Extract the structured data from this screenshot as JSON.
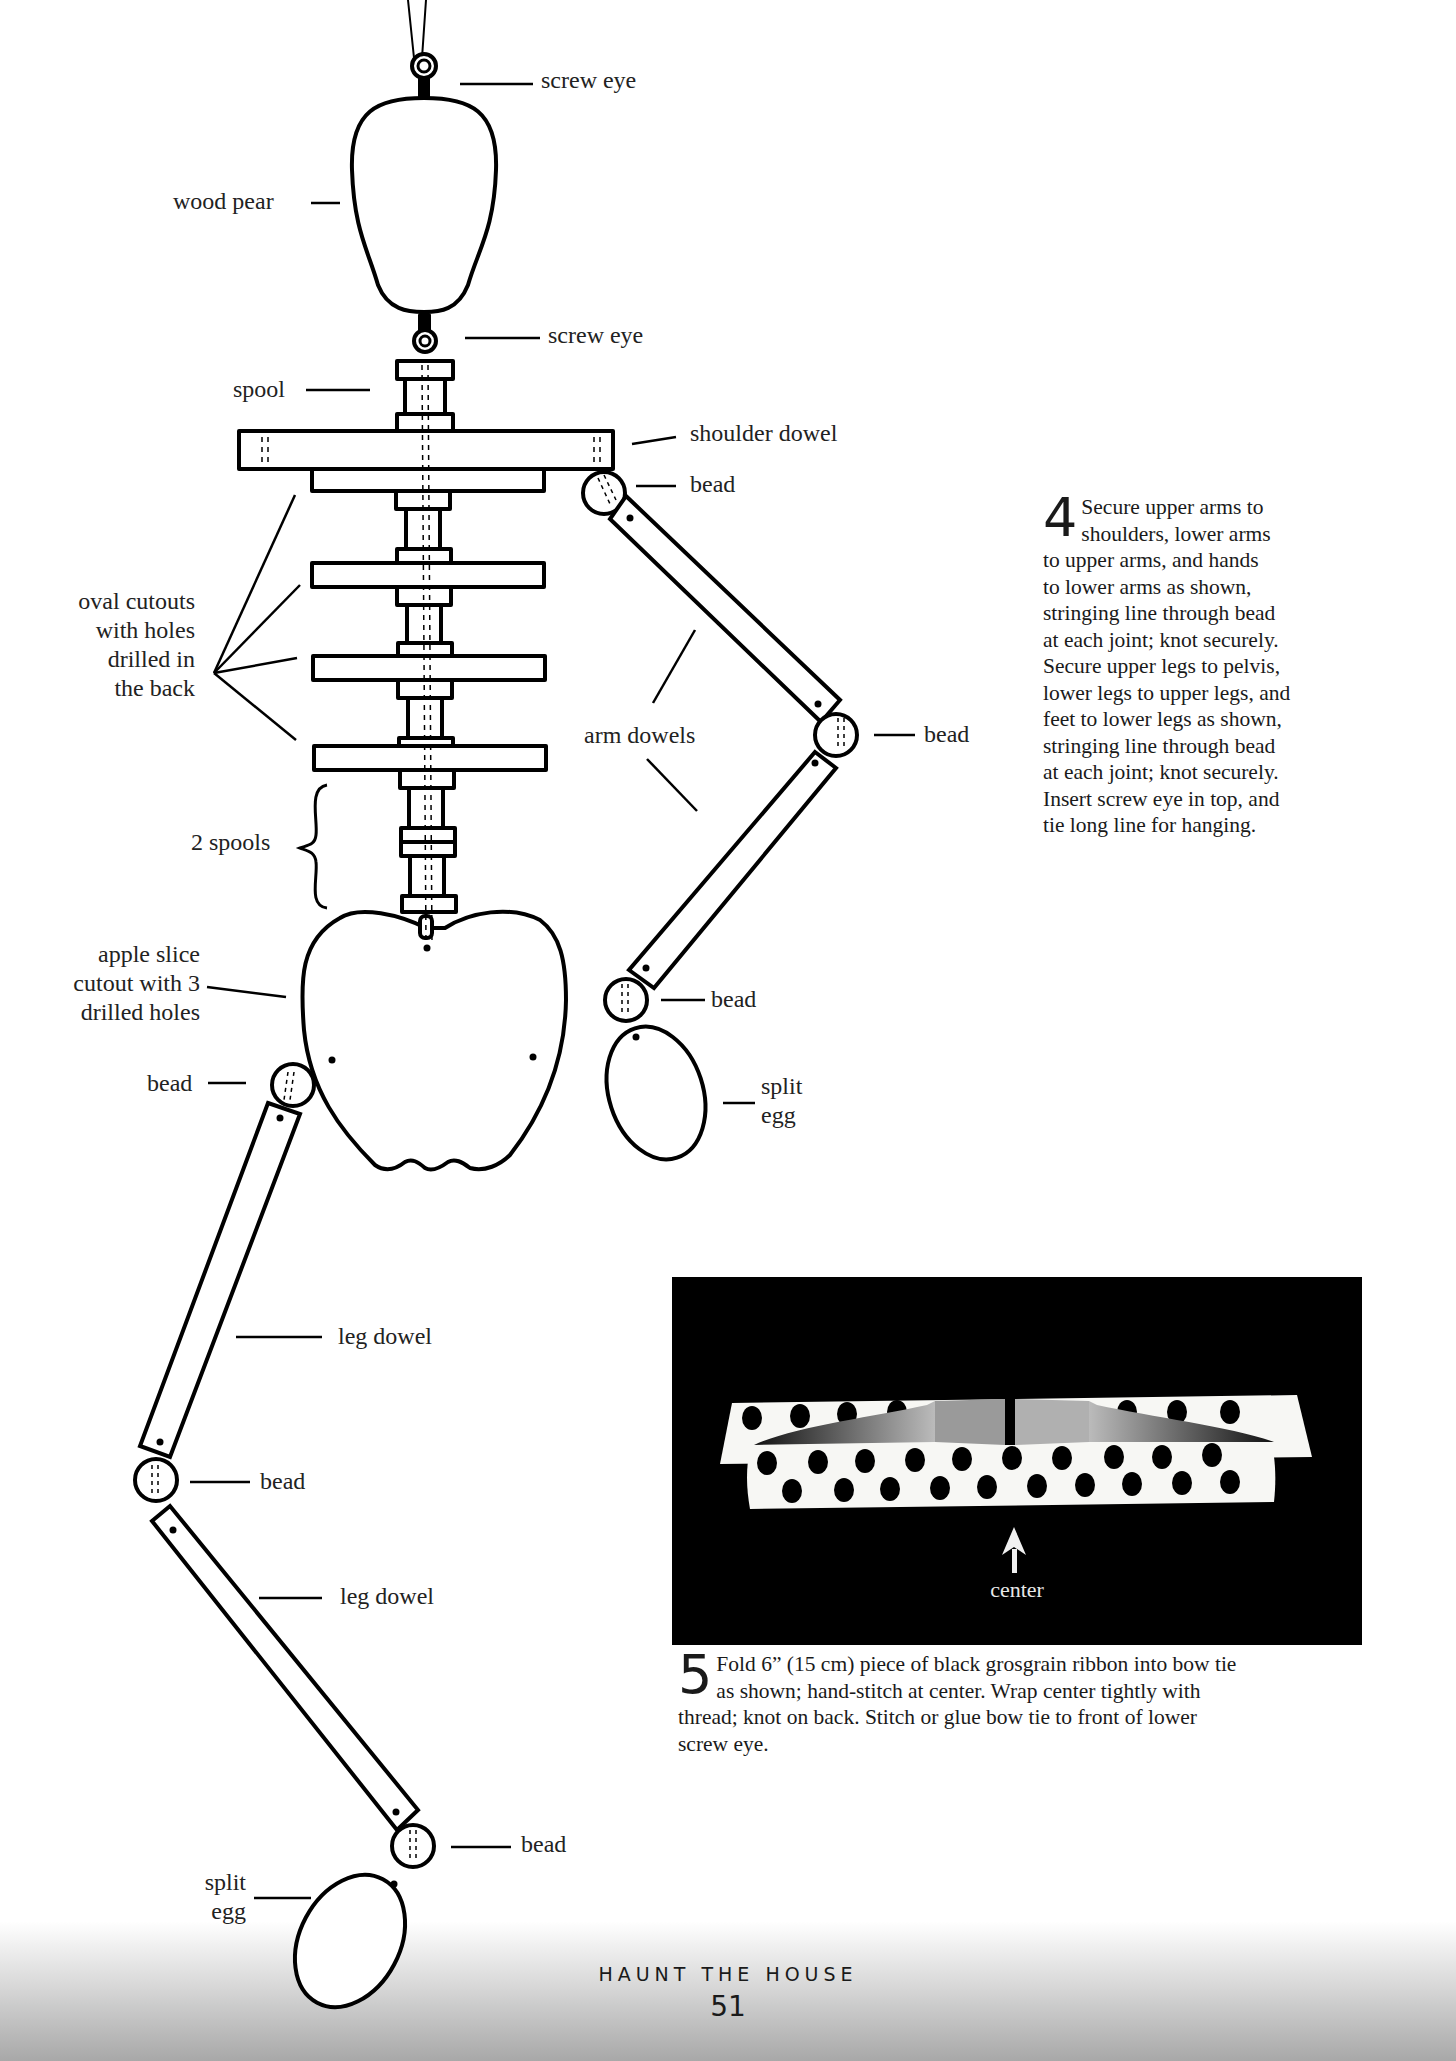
{
  "diagram": {
    "labels": {
      "screw_eye_top": "screw eye",
      "wood_pear": "wood pear",
      "screw_eye_lower": "screw eye",
      "spool": "spool",
      "shoulder_dowel": "shoulder dowel",
      "bead_shoulder": "bead",
      "oval_cutouts": [
        "oval cutouts",
        "with holes",
        "drilled in",
        "the back"
      ],
      "arm_dowels": "arm dowels",
      "bead_elbow": "bead",
      "two_spools": "2 spools",
      "apple_slice": [
        "apple slice",
        "cutout with 3",
        "drilled holes"
      ],
      "bead_wrist": "bead",
      "split_egg_hand": [
        "split",
        "egg"
      ],
      "bead_hip": "bead",
      "leg_dowel_upper": "leg dowel",
      "bead_knee": "bead",
      "leg_dowel_lower": "leg dowel",
      "bead_ankle": "bead",
      "split_egg_foot": [
        "split",
        "egg"
      ]
    }
  },
  "step4": {
    "number": "4",
    "lines": [
      "Secure upper arms to",
      "shoulders, lower arms",
      "to upper arms, and hands",
      "to lower arms as shown,",
      "stringing line through bead",
      "at each joint; knot securely.",
      "Secure upper legs to pelvis,",
      "lower legs to upper legs, and",
      "feet to lower legs as shown,",
      "stringing line through bead",
      "at each joint; knot securely.",
      "Insert screw eye in top, and",
      "tie long line for hanging."
    ]
  },
  "bow_figure": {
    "center_label": "center",
    "background": "#000000"
  },
  "step5": {
    "number": "5",
    "lines": [
      "Fold 6” (15 cm) piece of black grosgrain ribbon into bow tie",
      "as shown; hand-stitch at center. Wrap center tightly with",
      "thread; knot on back. Stitch or glue bow tie to front of lower",
      "screw eye."
    ]
  },
  "footer": {
    "title": "HAUNT THE HOUSE",
    "page_number": "51"
  }
}
